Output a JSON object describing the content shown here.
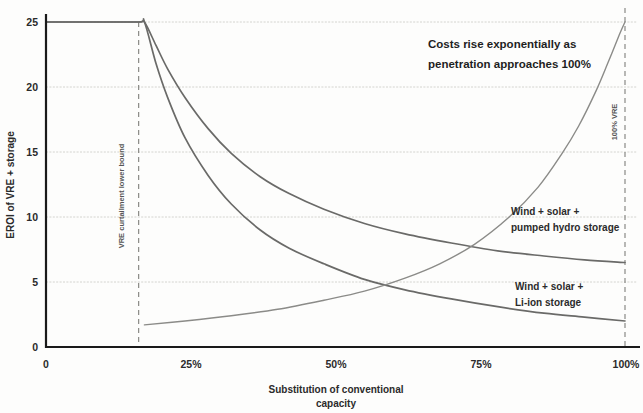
{
  "chart_data": {
    "type": "line",
    "title": "",
    "xlabel": "Substitution of conventional capacity",
    "ylabel": "EROI of VRE + storage",
    "xlim": [
      0,
      100
    ],
    "ylim": [
      0,
      25
    ],
    "grid": true,
    "legend_position": "inline-right",
    "x_ticks": [
      {
        "value": 0,
        "label": "0"
      },
      {
        "value": 25,
        "label": "25%"
      },
      {
        "value": 50,
        "label": "50%"
      },
      {
        "value": 75,
        "label": "75%"
      },
      {
        "value": 100,
        "label": "100%"
      }
    ],
    "y_ticks": [
      {
        "value": 0,
        "label": "0"
      },
      {
        "value": 5,
        "label": "5"
      },
      {
        "value": 10,
        "label": "10"
      },
      {
        "value": 15,
        "label": "15"
      },
      {
        "value": 20,
        "label": "20"
      },
      {
        "value": 25,
        "label": "25"
      }
    ],
    "series": [
      {
        "name": "Wind + solar + pumped hydro storage",
        "label_line1": "Wind + solar +",
        "label_line2": "pumped hydro storage",
        "x": [
          0,
          8,
          16,
          17,
          19,
          21,
          24,
          28,
          32,
          37,
          42,
          48,
          55,
          62,
          70,
          78,
          86,
          93,
          100
        ],
        "y": [
          25,
          25,
          25,
          25,
          23.2,
          21.4,
          19.2,
          16.8,
          14.9,
          13.1,
          11.8,
          10.6,
          9.5,
          8.7,
          8.0,
          7.4,
          7.0,
          6.7,
          6.5
        ]
      },
      {
        "name": "Wind + solar + Li-ion storage",
        "label_line1": "Wind + solar +",
        "label_line2": "Li-ion storage",
        "x": [
          0,
          8,
          16,
          17,
          19,
          21,
          24,
          28,
          32,
          37,
          42,
          48,
          55,
          62,
          70,
          78,
          86,
          93,
          100
        ],
        "y": [
          25,
          25,
          25,
          25,
          21.8,
          19.2,
          16.1,
          13.2,
          11.0,
          9.0,
          7.6,
          6.4,
          5.2,
          4.4,
          3.7,
          3.1,
          2.6,
          2.3,
          2.0
        ]
      },
      {
        "name": "Cost curve (rising)",
        "x": [
          17,
          24,
          32,
          40,
          48,
          55,
          62,
          68,
          74,
          80,
          85,
          89,
          92,
          95,
          97,
          99,
          100
        ],
        "y": [
          1.7,
          2.0,
          2.4,
          2.9,
          3.6,
          4.3,
          5.3,
          6.4,
          7.9,
          10.0,
          12.3,
          14.8,
          17.0,
          19.7,
          21.8,
          24.0,
          25.0
        ]
      }
    ],
    "annotations": [
      {
        "name": "cost-note",
        "line1": "Costs rise exponentially as",
        "line2": "penetration approaches 100%"
      },
      {
        "name": "vre-curtailment-marker",
        "text": "VRE curtailment lower bound",
        "x_value": 16
      },
      {
        "name": "full-vre-marker",
        "text": "100% VRE",
        "x_value": 100
      }
    ],
    "colors": {
      "curve": "#6a6a68",
      "curve_thin": "#8b8b88",
      "grid": "#c9c9c4",
      "axis": "#1a1a1a",
      "background": "#fdfdfc",
      "text": "#2b2b2b"
    }
  }
}
